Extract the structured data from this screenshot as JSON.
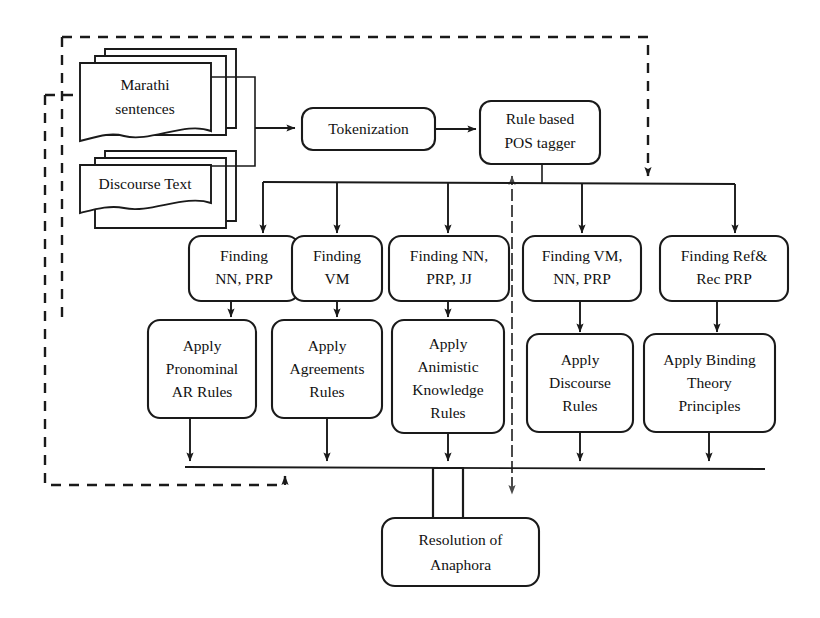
{
  "diagram": {
    "background_color": "#ffffff",
    "line_color": "#1a1a1a",
    "dashed_color": "#4a4a4a",
    "inputs": [
      {
        "id": "marathi-sentences",
        "label_line1": "Marathi",
        "label_line2": "sentences"
      },
      {
        "id": "discourse-text",
        "label_line1": "Discourse Text",
        "label_line2": ""
      }
    ],
    "preprocessing": [
      {
        "id": "tokenization",
        "label_line1": "Tokenization",
        "label_line2": ""
      },
      {
        "id": "rule-based-pos-tagger",
        "label_line1": "Rule based",
        "label_line2": "POS tagger"
      }
    ],
    "finding_stage": [
      {
        "id": "finding-nn-prp",
        "label_line1": "Finding",
        "label_line2": "NN, PRP",
        "label_line3": ""
      },
      {
        "id": "finding-vm",
        "label_line1": "Finding",
        "label_line2": "VM",
        "label_line3": ""
      },
      {
        "id": "finding-nn-prp-jj",
        "label_line1": "Finding NN,",
        "label_line2": "PRP, JJ",
        "label_line3": ""
      },
      {
        "id": "finding-vm-nn-prp",
        "label_line1": "Finding VM,",
        "label_line2": "NN, PRP",
        "label_line3": ""
      },
      {
        "id": "finding-ref-rec-prp",
        "label_line1": "Finding Ref&",
        "label_line2": "Rec PRP",
        "label_line3": ""
      }
    ],
    "apply_stage": [
      {
        "id": "apply-pronominal-ar-rules",
        "label_line1": "Apply",
        "label_line2": "Pronominal",
        "label_line3": "AR Rules",
        "label_line4": ""
      },
      {
        "id": "apply-agreements-rules",
        "label_line1": "Apply",
        "label_line2": "Agreements",
        "label_line3": "Rules",
        "label_line4": ""
      },
      {
        "id": "apply-animistic-knowledge-rules",
        "label_line1": "Apply",
        "label_line2": "Animistic",
        "label_line3": "Knowledge",
        "label_line4": "Rules"
      },
      {
        "id": "apply-discourse-rules",
        "label_line1": "Apply",
        "label_line2": "Discourse",
        "label_line3": "Rules",
        "label_line4": ""
      },
      {
        "id": "apply-binding-theory-principles",
        "label_line1": "Apply Binding",
        "label_line2": "Theory",
        "label_line3": "Principles",
        "label_line4": ""
      }
    ],
    "output": {
      "id": "resolution-of-anaphora",
      "label_line1": "Resolution of",
      "label_line2": "Anaphora"
    }
  }
}
